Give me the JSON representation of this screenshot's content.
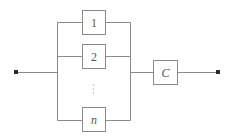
{
  "diagram": {
    "type": "reliability-block-diagram",
    "colors": {
      "wire": "#8a8a8a",
      "terminal": "#2a2a2a",
      "label": "#555555"
    },
    "terminals": [
      {
        "id": "input",
        "label": ""
      },
      {
        "id": "output",
        "label": ""
      }
    ],
    "parallel_blocks": [
      {
        "id": "block-1",
        "label": "1"
      },
      {
        "id": "block-2",
        "label": "2"
      },
      {
        "id": "block-ellipsis",
        "label": "⋮"
      },
      {
        "id": "block-n",
        "label": "n"
      }
    ],
    "series_block": {
      "id": "block-c",
      "label": "C"
    }
  }
}
